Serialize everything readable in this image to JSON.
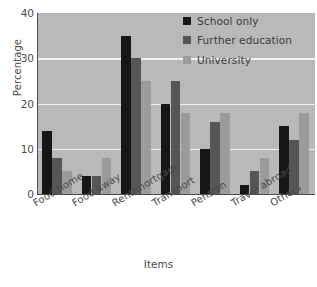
{
  "chart_data": {
    "type": "bar",
    "title": "",
    "xlabel": "Items",
    "ylabel": "Percentage",
    "categories": [
      "Food home",
      "Food away",
      "Rent/mortgage",
      "Transport",
      "Pension",
      "Travel abroad",
      "Others"
    ],
    "series": [
      {
        "name": "School only",
        "color": "#161616",
        "values": [
          14,
          4,
          35,
          20,
          10,
          2,
          15
        ]
      },
      {
        "name": "Further education",
        "color": "#565656",
        "values": [
          8,
          4,
          30,
          25,
          16,
          5,
          12
        ]
      },
      {
        "name": "University",
        "color": "#9b9b9b",
        "values": [
          5,
          8,
          25,
          18,
          18,
          8,
          18
        ]
      }
    ],
    "ylim": [
      0,
      40
    ],
    "yticks": [
      0,
      10,
      20,
      30,
      40
    ],
    "grid": true,
    "legend_position": "top-right",
    "plot_background": "#b9b9b9",
    "gridline_color": "#f2f2f2"
  }
}
